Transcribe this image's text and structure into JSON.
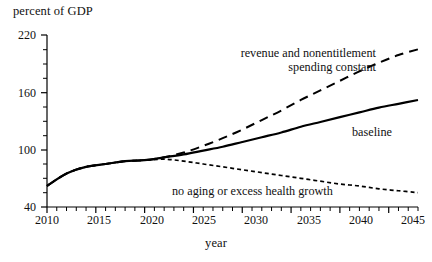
{
  "chart_data": {
    "type": "line",
    "title": "",
    "ylabel": "percent of GDP",
    "xlabel": "year",
    "xlim": [
      2010,
      2048
    ],
    "ylim": [
      40,
      220
    ],
    "yticks": [
      40,
      100,
      160,
      220
    ],
    "yminor_step": 15,
    "xticks": [
      2010,
      2015,
      2020,
      2025,
      2030,
      2035,
      2040,
      2045
    ],
    "xminor_step": 1,
    "grid": false,
    "legend_position": "inline-annotations",
    "series": [
      {
        "name": "revenue and nonentitlement spending constant",
        "style": "dashed",
        "color": "#000000",
        "x": [
          2010,
          2012,
          2014,
          2016,
          2018,
          2020,
          2022,
          2024,
          2026,
          2028,
          2030,
          2032,
          2034,
          2036,
          2038,
          2040,
          2042,
          2044,
          2046,
          2048
        ],
        "y": [
          62,
          75,
          82,
          85,
          88,
          89,
          92,
          97,
          104,
          112,
          121,
          131,
          141,
          152,
          162,
          172,
          182,
          191,
          199,
          205
        ]
      },
      {
        "name": "baseline",
        "style": "solid",
        "color": "#000000",
        "x": [
          2010,
          2012,
          2014,
          2016,
          2018,
          2020,
          2022,
          2024,
          2026,
          2028,
          2030,
          2032,
          2034,
          2036,
          2038,
          2040,
          2042,
          2044,
          2046,
          2048
        ],
        "y": [
          62,
          75,
          82,
          85,
          88,
          89,
          92,
          95,
          99,
          103,
          108,
          113,
          118,
          124,
          129,
          134,
          139,
          144,
          148,
          152
        ]
      },
      {
        "name": "no aging or excess health growth",
        "style": "dotted",
        "color": "#000000",
        "x": [
          2010,
          2012,
          2014,
          2016,
          2018,
          2020,
          2022,
          2024,
          2026,
          2028,
          2030,
          2032,
          2034,
          2036,
          2038,
          2040,
          2042,
          2044,
          2046,
          2048
        ],
        "y": [
          62,
          75,
          82,
          85,
          88,
          89,
          90,
          88,
          85,
          82,
          79,
          76,
          73,
          70,
          67,
          64,
          62,
          59,
          57,
          55
        ]
      }
    ],
    "annotations": [
      {
        "name": "dashed-label",
        "text_line1": "revenue and nonentitlement",
        "text_line2": "spending constant"
      },
      {
        "name": "solid-label",
        "text": "baseline"
      },
      {
        "name": "dotted-label",
        "text": "no aging or excess health growth"
      }
    ]
  },
  "labels": {
    "ylabel": "percent of GDP",
    "xlabel": "year",
    "ytick_0": "40",
    "ytick_1": "100",
    "ytick_2": "160",
    "ytick_3": "220",
    "xtick_0": "2010",
    "xtick_1": "2015",
    "xtick_2": "2020",
    "xtick_3": "2025",
    "xtick_4": "2030",
    "xtick_5": "2035",
    "xtick_6": "2040",
    "xtick_7": "2045",
    "annot_dashed_1": "revenue and nonentitlement",
    "annot_dashed_2": "spending constant",
    "annot_solid": "baseline",
    "annot_dotted": "no aging or excess health growth"
  }
}
